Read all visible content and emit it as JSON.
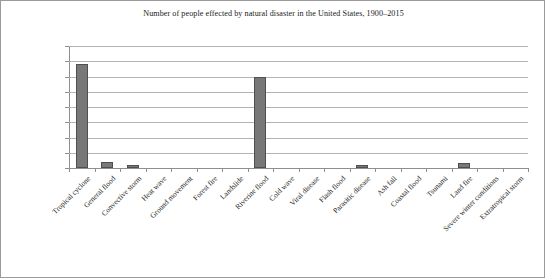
{
  "chart_data": {
    "type": "bar",
    "title": "Number of people effected by natural disaster in the United States, 1900–2015",
    "xlabel": "",
    "ylabel": "",
    "ylim": [
      0,
      16000000
    ],
    "ytick_labels": [
      "16,000,000",
      "14,000,000",
      "12,000,000",
      "10,000,000",
      "8,000,000",
      "6,000,000",
      "4,000,000",
      "2,000,000",
      "0"
    ],
    "ytick_values": [
      16000000,
      14000000,
      12000000,
      10000000,
      8000000,
      6000000,
      4000000,
      2000000,
      0
    ],
    "grid": true,
    "legend": false,
    "bar_color": "#787878",
    "bar_edge_color": "#4f4f4f",
    "gridline_color": "#b4b4b4",
    "axis_color": "#8e8e8e",
    "categories": [
      "Tropical cyclone",
      "General flood",
      "Convective storm",
      "Heat wave",
      "Ground movement",
      "Forest fire",
      "Landslide",
      "Riverine flood",
      "Cold wave",
      "Viral disease",
      "Flash flood",
      "Parasitic disease",
      "Ash fall",
      "Coastal flood",
      "Tsunami",
      "Land fire",
      "Severe winter conditions",
      "Extratropical storm"
    ],
    "values": [
      13600000,
      800000,
      400000,
      40000,
      30000,
      90000,
      80000,
      12000000,
      30000,
      20000,
      20000,
      420000,
      15000,
      15000,
      10000,
      620000,
      10000,
      10000
    ]
  }
}
